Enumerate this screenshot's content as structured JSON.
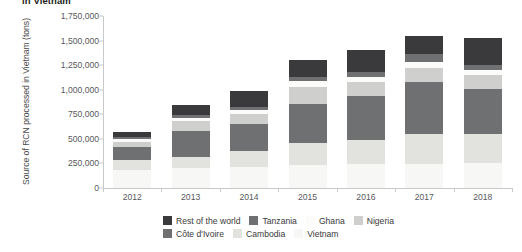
{
  "title": "in Vietnam",
  "chart_data": {
    "type": "bar",
    "subtype": "stacked-bar",
    "title": "in Vietnam",
    "xlabel": "",
    "ylabel": "Source of RCN processed in Vietnam (tons)",
    "ylim": [
      0,
      1750000
    ],
    "ytick_values": [
      0,
      250000,
      500000,
      750000,
      1000000,
      1250000,
      1500000,
      1750000
    ],
    "ytick_labels": [
      "0",
      "250,000",
      "500,000",
      "750,000",
      "1,000,000",
      "1,250,000",
      "1,500,000",
      "1,750,000"
    ],
    "grid": false,
    "legend_position": "bottom",
    "categories": [
      "2012",
      "2013",
      "2014",
      "2015",
      "2016",
      "2017",
      "2018"
    ],
    "series": [
      {
        "name": "Vietnam",
        "color": "#f7f7f5",
        "values": [
          180000,
          200000,
          210000,
          230000,
          240000,
          245000,
          250000
        ]
      },
      {
        "name": "Cambodia",
        "color": "#e2e2de",
        "values": [
          110000,
          120000,
          170000,
          230000,
          250000,
          300000,
          300000
        ]
      },
      {
        "name": "Côte d'Ivoire",
        "color": "#6f7072",
        "values": [
          130000,
          260000,
          270000,
          400000,
          450000,
          530000,
          460000
        ]
      },
      {
        "name": "Nigeria",
        "color": "#cfd0cd",
        "values": [
          50000,
          100000,
          105000,
          170000,
          140000,
          145000,
          135000
        ]
      },
      {
        "name": "Ghana",
        "color": "#fbfbfa",
        "values": [
          25000,
          35000,
          40000,
          55000,
          55000,
          60000,
          55000
        ]
      },
      {
        "name": "Tanzania",
        "color": "#6f7072",
        "values": [
          20000,
          25000,
          30000,
          45000,
          50000,
          80000,
          50000
        ]
      },
      {
        "name": "Rest of the world",
        "color": "#3a3a3c",
        "values": [
          55000,
          100000,
          160000,
          170000,
          220000,
          190000,
          280000
        ]
      }
    ],
    "totals": [
      570000,
      840000,
      985000,
      1300000,
      1405000,
      1550000,
      1530000
    ]
  },
  "legend": {
    "rows": [
      [
        {
          "label": "Rest of the world",
          "color": "#3a3a3c"
        },
        {
          "label": "Tanzania",
          "color": "#6f7072"
        },
        {
          "label": "Ghana",
          "color": "#fbfbfa"
        },
        {
          "label": "Nigeria",
          "color": "#cfd0cd"
        }
      ],
      [
        {
          "label": "Côte d'Ivoire",
          "color": "#6f7072"
        },
        {
          "label": "Cambodia",
          "color": "#e2e2de"
        },
        {
          "label": "Vietnam",
          "color": "#f7f7f5"
        }
      ]
    ]
  }
}
